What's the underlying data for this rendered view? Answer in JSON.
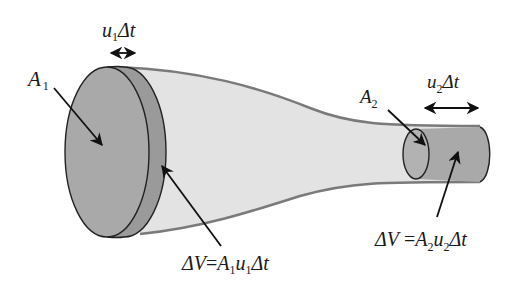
{
  "diagram": {
    "colors": {
      "background": "#ffffff",
      "pipe_fill": "#e3e3e3",
      "pipe_outline": "#7a7a7a",
      "disk_fill": "#a9a9a9",
      "disk_rim": "#9a9a9a",
      "outline": "#222222",
      "arrow": "#111111",
      "text": "#1a1a1a"
    },
    "labels": {
      "u1dt": {
        "main": "u",
        "sub": "1",
        "rest": "Δt"
      },
      "A1": {
        "main": "A",
        "sub": "1"
      },
      "A2": {
        "main": "A",
        "sub": "2"
      },
      "u2dt": {
        "main": "u",
        "sub": "2",
        "rest": "Δt"
      },
      "dV1": {
        "prefix": "ΔV",
        "eq": "=",
        "a": "A",
        "a_sub": "1",
        "u": "u",
        "u_sub": "1",
        "rest": "Δt"
      },
      "dV2": {
        "prefix": "ΔV",
        "eq": " =",
        "a": "A",
        "a_sub": "2",
        "u": "u",
        "u_sub": "2",
        "rest": "Δt"
      }
    }
  }
}
